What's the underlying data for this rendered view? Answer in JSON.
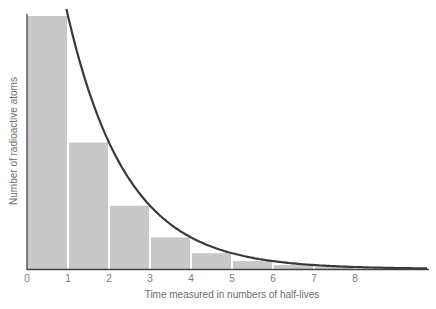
{
  "chart_data": {
    "type": "bar",
    "title": "",
    "xlabel": "Time measured in numbers of half-lives",
    "ylabel": "Number of radioactive atoms",
    "x_ticks": [
      "0",
      "1",
      "2",
      "3",
      "4",
      "5",
      "6",
      "7",
      "8"
    ],
    "categories": [
      "0-1",
      "1-2",
      "2-3",
      "3-4",
      "4-5",
      "5-6",
      "6-7",
      "7-8"
    ],
    "series": [
      {
        "name": "Remaining atoms (bars)",
        "type": "bar",
        "values": [
          1,
          0.5,
          0.25,
          0.125,
          0.0625,
          0.03125,
          0.015625,
          0.0078125
        ]
      },
      {
        "name": "Exponential decay curve",
        "type": "line",
        "x": [
          1,
          2,
          3,
          4,
          5,
          6,
          7,
          8,
          9
        ],
        "values": [
          1,
          0.5,
          0.25,
          0.125,
          0.0625,
          0.03125,
          0.015625,
          0.0078125,
          0.0039
        ]
      }
    ],
    "xlim": [
      0,
      9
    ],
    "ylim": [
      0,
      1.03
    ],
    "grid": false,
    "legend": "none",
    "y_ticks_shown": false
  },
  "colors": {
    "bar": "#c8c8c8",
    "bar_separator": "#ffffff",
    "curve": "#3a3a3a",
    "axis": "#444444",
    "text": "#7a7a7a"
  }
}
